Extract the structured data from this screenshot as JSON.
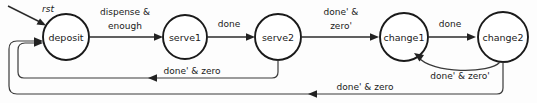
{
  "diagram": {
    "type": "finite-state-machine",
    "title": "",
    "reset_label": "rst",
    "states": [
      {
        "id": "deposit",
        "label": "deposit",
        "cx": 66,
        "cy": 37,
        "r": 23
      },
      {
        "id": "serve1",
        "label": "serve1",
        "cx": 185,
        "cy": 37,
        "r": 22
      },
      {
        "id": "serve2",
        "label": "serve2",
        "cx": 278,
        "cy": 37,
        "r": 23
      },
      {
        "id": "change1",
        "label": "change1",
        "cx": 404,
        "cy": 37,
        "r": 24
      },
      {
        "id": "change2",
        "label": "change2",
        "cx": 503,
        "cy": 37,
        "r": 25
      }
    ],
    "transitions": [
      {
        "id": "t-reset",
        "from": "",
        "to": "deposit",
        "label": "rst"
      },
      {
        "id": "t-deposit-serve1",
        "from": "deposit",
        "to": "serve1",
        "label_line1": "dispense &",
        "label_line2": "enough"
      },
      {
        "id": "t-serve1-serve2",
        "from": "serve1",
        "to": "serve2",
        "label": "done"
      },
      {
        "id": "t-serve2-change1",
        "from": "serve2",
        "to": "change1",
        "label_line1": "done' &",
        "label_line2": "zero'"
      },
      {
        "id": "t-change1-change2",
        "from": "change1",
        "to": "change2",
        "label": "done"
      },
      {
        "id": "t-change2-change1",
        "from": "change2",
        "to": "change1",
        "label": "done' & zero'"
      },
      {
        "id": "t-serve2-deposit",
        "from": "serve2",
        "to": "deposit",
        "label": "done' & zero"
      },
      {
        "id": "t-change2-deposit",
        "from": "change2",
        "to": "deposit",
        "label": "done' & zero"
      }
    ]
  }
}
